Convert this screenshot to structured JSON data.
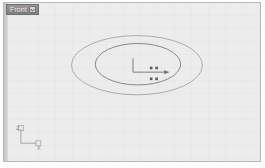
{
  "viewport": {
    "label": "Front",
    "caret_icon": "chevron-down-icon",
    "background_color": "#ececec",
    "border_color": "#b9b9b9"
  },
  "scene": {
    "line_color": "#8a8a8a",
    "gizmo_color": "#6f6f6f",
    "objects": [
      {
        "name": "outer-ellipse",
        "type": "ellipse",
        "cx": 134,
        "cy": 63,
        "rx": 66,
        "ry": 30
      },
      {
        "name": "inner-ellipse",
        "type": "ellipse",
        "cx": 135,
        "cy": 62,
        "rx": 43,
        "ry": 21
      }
    ],
    "gizmo": {
      "name": "transform-gizmo",
      "origin_x": 130,
      "origin_y": 70,
      "z_axis_length": 14,
      "x_axis_length": 36,
      "handle_count": 4
    }
  },
  "axis_tripod": {
    "z_label": "Z",
    "x_label": "X",
    "color": "#9a9a9a"
  }
}
